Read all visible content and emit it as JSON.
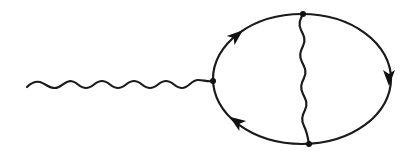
{
  "diagram": {
    "type": "feynman-diagram",
    "colors": {
      "stroke": "#1a1a1a",
      "background": "#ffffff"
    },
    "elements": {
      "external_photon": {
        "kind": "wavy-line",
        "from": [
          27,
          86
        ],
        "to": [
          213,
          81
        ]
      },
      "fermion_loop": {
        "kind": "ellipse",
        "cx": 301,
        "cy": 79,
        "rx": 88,
        "ry": 65
      },
      "internal_photon": {
        "kind": "wavy-line",
        "from": [
          303,
          14
        ],
        "to": [
          309,
          144
        ]
      },
      "vertices": [
        {
          "name": "left-vertex",
          "x": 213,
          "y": 81
        },
        {
          "name": "top-vertex",
          "x": 303,
          "y": 14
        },
        {
          "name": "bottom-vertex",
          "x": 309,
          "y": 144
        }
      ],
      "arrows": [
        {
          "name": "upper-left-arrow",
          "x": 236,
          "y": 37,
          "direction": "up-right"
        },
        {
          "name": "right-arrow",
          "x": 388,
          "y": 77,
          "direction": "down"
        },
        {
          "name": "lower-left-arrow",
          "x": 238,
          "y": 122,
          "direction": "up-left"
        }
      ]
    }
  }
}
